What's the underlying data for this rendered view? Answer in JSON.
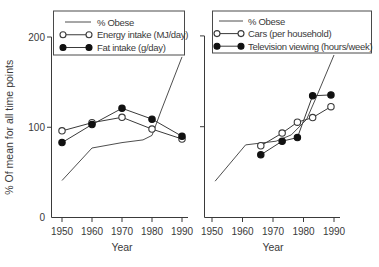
{
  "figure": {
    "background": "#ffffff",
    "ink_color": "#3a3a3a",
    "marker_fill_color": "#111111",
    "ylabel": "% Of mean for all time points",
    "xlabel": "Year"
  },
  "chart_data": [
    {
      "type": "line",
      "panel": "left",
      "title": "",
      "xlabel": "Year",
      "ylabel": "% Of mean for all time points",
      "xlim": [
        1946,
        1992
      ],
      "ylim": [
        0,
        220
      ],
      "xticks": [
        1950,
        1960,
        1970,
        1980,
        1990
      ],
      "yticks": [
        0,
        100,
        200
      ],
      "ytick_labels_visible": true,
      "grid": false,
      "legend_position": "top-box",
      "series": [
        {
          "name": "% Obese",
          "marker": "none",
          "x": [
            1950,
            1960,
            1970,
            1977,
            1980,
            1983,
            1990
          ],
          "y": [
            41,
            77,
            83,
            86,
            91,
            118,
            178
          ]
        },
        {
          "name": "Energy intake (MJ/day)",
          "marker": "open-circle",
          "x": [
            1950,
            1960,
            1970,
            1980,
            1990
          ],
          "y": [
            96,
            105,
            111,
            98,
            87
          ]
        },
        {
          "name": "Fat intake (g/day)",
          "marker": "filled-circle",
          "x": [
            1950,
            1960,
            1970,
            1980,
            1990
          ],
          "y": [
            83,
            103,
            121,
            109,
            90
          ]
        }
      ]
    },
    {
      "type": "line",
      "panel": "right",
      "title": "",
      "xlabel": "Year",
      "ylabel": "",
      "xlim": [
        1946,
        1992
      ],
      "ylim": [
        0,
        220
      ],
      "xticks": [
        1950,
        1960,
        1970,
        1980,
        1990
      ],
      "yticks": [
        100,
        200
      ],
      "ytick_labels_visible": false,
      "grid": false,
      "legend_position": "top-box",
      "series": [
        {
          "name": "% Obese",
          "marker": "none",
          "x": [
            1951,
            1961,
            1971,
            1976,
            1981,
            1984,
            1990
          ],
          "y": [
            40,
            80,
            84,
            91,
            108,
            131,
            179
          ]
        },
        {
          "name": "Cars (per household)",
          "marker": "open-circle",
          "x": [
            1966,
            1973,
            1978,
            1983,
            1989
          ],
          "y": [
            79,
            93,
            105,
            110,
            122
          ]
        },
        {
          "name": "Television viewing (hours/week)",
          "marker": "filled-circle",
          "x": [
            1966,
            1973,
            1978,
            1983,
            1989
          ],
          "y": [
            69,
            84,
            88,
            134,
            135
          ]
        }
      ]
    }
  ]
}
